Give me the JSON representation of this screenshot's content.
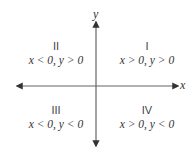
{
  "axes": {
    "x_label": "x",
    "y_label": "y"
  },
  "quadrants": [
    {
      "numeral": "I",
      "condition": "x > 0, y > 0"
    },
    {
      "numeral": "II",
      "condition": "x < 0, y > 0"
    },
    {
      "numeral": "III",
      "condition": "x < 0, y < 0"
    },
    {
      "numeral": "IV",
      "condition": "x > 0, y < 0"
    }
  ],
  "colors": {
    "axis": "#555555",
    "text": "#333333",
    "background": "#ffffff"
  }
}
